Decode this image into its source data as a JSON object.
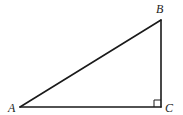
{
  "diagram": {
    "type": "right-triangle",
    "stroke_color": "#1a1a1a",
    "vertices": [
      {
        "id": "A",
        "label": "A",
        "x": 20,
        "y": 107,
        "label_x": 8,
        "label_y": 112
      },
      {
        "id": "B",
        "label": "B",
        "x": 161,
        "y": 20,
        "label_x": 156,
        "label_y": 13
      },
      {
        "id": "C",
        "label": "C",
        "x": 161,
        "y": 107,
        "label_x": 165,
        "label_y": 112
      }
    ],
    "edges": [
      {
        "from": "A",
        "to": "B"
      },
      {
        "from": "B",
        "to": "C"
      },
      {
        "from": "A",
        "to": "C"
      }
    ],
    "right_angle": {
      "at": "C",
      "size": 7
    }
  }
}
